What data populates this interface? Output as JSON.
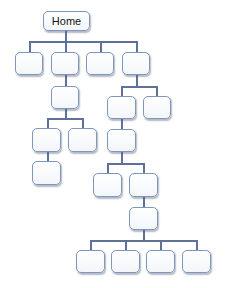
{
  "diagram": {
    "type": "sitemap-tree",
    "root": {
      "label": "Home"
    },
    "colors": {
      "node_border": "#7d97bd",
      "node_fill": "#ffffff",
      "connector": "#5d7199"
    },
    "nodes": [
      {
        "id": "home",
        "label": "Home",
        "x": 43,
        "y": 11,
        "w": 47,
        "h": 20
      },
      {
        "id": "n1",
        "label": "",
        "x": 15,
        "y": 52,
        "w": 28,
        "h": 23
      },
      {
        "id": "n2",
        "label": "",
        "x": 51,
        "y": 52,
        "w": 28,
        "h": 23
      },
      {
        "id": "n3",
        "label": "",
        "x": 86,
        "y": 52,
        "w": 28,
        "h": 23
      },
      {
        "id": "n4",
        "label": "",
        "x": 122,
        "y": 52,
        "w": 28,
        "h": 23
      },
      {
        "id": "n2a",
        "label": "",
        "x": 51,
        "y": 86,
        "w": 28,
        "h": 23
      },
      {
        "id": "n4a",
        "label": "",
        "x": 107,
        "y": 96,
        "w": 29,
        "h": 23
      },
      {
        "id": "n4b",
        "label": "",
        "x": 143,
        "y": 96,
        "w": 28,
        "h": 23
      },
      {
        "id": "n2a1",
        "label": "",
        "x": 32,
        "y": 128,
        "w": 29,
        "h": 24
      },
      {
        "id": "n2a2",
        "label": "",
        "x": 68,
        "y": 128,
        "w": 29,
        "h": 24
      },
      {
        "id": "n2a1a",
        "label": "",
        "x": 32,
        "y": 161,
        "w": 29,
        "h": 24
      },
      {
        "id": "n4a1",
        "label": "",
        "x": 107,
        "y": 129,
        "w": 29,
        "h": 23
      },
      {
        "id": "n4a1a",
        "label": "",
        "x": 93,
        "y": 173,
        "w": 29,
        "h": 24
      },
      {
        "id": "n4a1b",
        "label": "",
        "x": 129,
        "y": 173,
        "w": 29,
        "h": 24
      },
      {
        "id": "n4a1b1",
        "label": "",
        "x": 129,
        "y": 207,
        "w": 29,
        "h": 23
      },
      {
        "id": "leaf1",
        "label": "",
        "x": 76,
        "y": 250,
        "w": 29,
        "h": 23
      },
      {
        "id": "leaf2",
        "label": "",
        "x": 111,
        "y": 250,
        "w": 29,
        "h": 23
      },
      {
        "id": "leaf3",
        "label": "",
        "x": 146,
        "y": 250,
        "w": 29,
        "h": 23
      },
      {
        "id": "leaf4",
        "label": "",
        "x": 182,
        "y": 250,
        "w": 29,
        "h": 23
      }
    ],
    "edges": [
      [
        "home",
        "n1"
      ],
      [
        "home",
        "n2"
      ],
      [
        "home",
        "n3"
      ],
      [
        "home",
        "n4"
      ],
      [
        "n2",
        "n2a"
      ],
      [
        "n4",
        "n4a"
      ],
      [
        "n4",
        "n4b"
      ],
      [
        "n2a",
        "n2a1"
      ],
      [
        "n2a",
        "n2a2"
      ],
      [
        "n2a1",
        "n2a1a"
      ],
      [
        "n4a",
        "n4a1"
      ],
      [
        "n4a1",
        "n4a1a"
      ],
      [
        "n4a1",
        "n4a1b"
      ],
      [
        "n4a1b",
        "n4a1b1"
      ],
      [
        "n4a1b1",
        "leaf1"
      ],
      [
        "n4a1b1",
        "leaf2"
      ],
      [
        "n4a1b1",
        "leaf3"
      ],
      [
        "n4a1b1",
        "leaf4"
      ]
    ]
  }
}
